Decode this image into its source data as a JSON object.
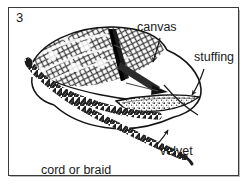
{
  "figure": {
    "number": "3",
    "frame_color": "#3a3a3a",
    "ink_color": "#1a1a1a",
    "background_color": "#ffffff"
  },
  "labels": [
    {
      "id": "canvas",
      "text": "canvas",
      "x": 129,
      "y": 24,
      "anchor": "start",
      "points_to": "patterned-needlepoint-top"
    },
    {
      "id": "stuffing",
      "text": "stuffing",
      "x": 186,
      "y": 54,
      "anchor": "start",
      "points_to": "stuffing-layer"
    },
    {
      "id": "velvet",
      "text": "velvet",
      "x": 152,
      "y": 148,
      "anchor": "start",
      "points_to": "velvet-underside"
    },
    {
      "id": "cord",
      "text": "cord or braid",
      "x": 33,
      "y": 167,
      "anchor": "start",
      "points_to": "cord-trim"
    }
  ],
  "parts": [
    {
      "id": "canvas",
      "name": "canvas",
      "description": "patterned needlepoint canvas forming the top face of the cushion"
    },
    {
      "id": "stuffing",
      "name": "stuffing",
      "description": "speckled filling layer sandwiched between canvas and velvet"
    },
    {
      "id": "velvet",
      "name": "velvet",
      "description": "plain velvet underside of the cushion"
    },
    {
      "id": "cord",
      "name": "cord or braid",
      "description": "twisted cord or braid trim sewn around the seam and trailing off to the lower left"
    }
  ],
  "icons": {
    "arrowhead": "leader-arrow"
  }
}
